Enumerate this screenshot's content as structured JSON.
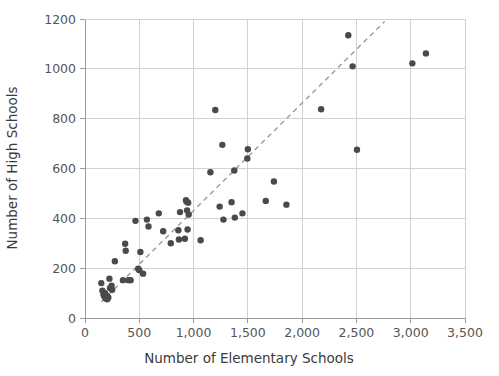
{
  "chart_data": {
    "type": "scatter",
    "title": "",
    "xlabel": "Number of Elementary Schools",
    "ylabel": "Number of High Schools",
    "xlim": [
      0,
      3500
    ],
    "ylim": [
      0,
      1200
    ],
    "xticks": [
      0,
      500,
      1000,
      1500,
      2000,
      2500,
      3000,
      3500
    ],
    "xtick_labels": [
      "0",
      "500",
      "1,000",
      "1,500",
      "2,000",
      "2,500",
      "3,000",
      "3,500"
    ],
    "yticks": [
      0,
      200,
      400,
      600,
      800,
      1000,
      1200
    ],
    "ytick_labels": [
      "0",
      "200",
      "400",
      "600",
      "800",
      "1000",
      "1200"
    ],
    "grid": true,
    "legend": "none",
    "marker_color": "#4a4a4a",
    "marker_size": 6.4,
    "trendline": {
      "style": "dashed",
      "color": "#9a9a9a",
      "x_start": 150,
      "y_start": 65,
      "x_end": 2760,
      "y_end": 1190
    },
    "points": [
      {
        "x": 150,
        "y": 140
      },
      {
        "x": 160,
        "y": 110
      },
      {
        "x": 170,
        "y": 95
      },
      {
        "x": 175,
        "y": 88
      },
      {
        "x": 185,
        "y": 100
      },
      {
        "x": 190,
        "y": 78
      },
      {
        "x": 195,
        "y": 85
      },
      {
        "x": 200,
        "y": 90
      },
      {
        "x": 205,
        "y": 75
      },
      {
        "x": 215,
        "y": 82
      },
      {
        "x": 225,
        "y": 158
      },
      {
        "x": 230,
        "y": 120
      },
      {
        "x": 245,
        "y": 130
      },
      {
        "x": 250,
        "y": 113
      },
      {
        "x": 275,
        "y": 228
      },
      {
        "x": 350,
        "y": 152
      },
      {
        "x": 370,
        "y": 298
      },
      {
        "x": 375,
        "y": 270
      },
      {
        "x": 400,
        "y": 152
      },
      {
        "x": 420,
        "y": 152
      },
      {
        "x": 465,
        "y": 390
      },
      {
        "x": 490,
        "y": 198
      },
      {
        "x": 500,
        "y": 192
      },
      {
        "x": 510,
        "y": 265
      },
      {
        "x": 535,
        "y": 178
      },
      {
        "x": 570,
        "y": 395
      },
      {
        "x": 585,
        "y": 367
      },
      {
        "x": 680,
        "y": 420
      },
      {
        "x": 720,
        "y": 348
      },
      {
        "x": 790,
        "y": 300
      },
      {
        "x": 860,
        "y": 352
      },
      {
        "x": 865,
        "y": 315
      },
      {
        "x": 875,
        "y": 425
      },
      {
        "x": 920,
        "y": 318
      },
      {
        "x": 930,
        "y": 473
      },
      {
        "x": 935,
        "y": 468
      },
      {
        "x": 940,
        "y": 432
      },
      {
        "x": 945,
        "y": 355
      },
      {
        "x": 950,
        "y": 463
      },
      {
        "x": 955,
        "y": 415
      },
      {
        "x": 1065,
        "y": 312
      },
      {
        "x": 1155,
        "y": 585
      },
      {
        "x": 1200,
        "y": 835
      },
      {
        "x": 1240,
        "y": 447
      },
      {
        "x": 1265,
        "y": 695
      },
      {
        "x": 1275,
        "y": 395
      },
      {
        "x": 1350,
        "y": 465
      },
      {
        "x": 1375,
        "y": 592
      },
      {
        "x": 1380,
        "y": 403
      },
      {
        "x": 1450,
        "y": 420
      },
      {
        "x": 1495,
        "y": 640
      },
      {
        "x": 1500,
        "y": 677
      },
      {
        "x": 1665,
        "y": 470
      },
      {
        "x": 1740,
        "y": 548
      },
      {
        "x": 1855,
        "y": 455
      },
      {
        "x": 2175,
        "y": 838
      },
      {
        "x": 2425,
        "y": 1135
      },
      {
        "x": 2465,
        "y": 1010
      },
      {
        "x": 2505,
        "y": 675
      },
      {
        "x": 3015,
        "y": 1022
      },
      {
        "x": 3140,
        "y": 1062
      }
    ]
  }
}
